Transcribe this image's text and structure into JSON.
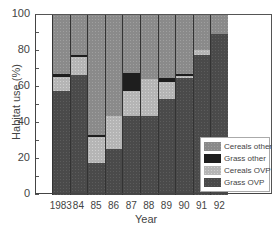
{
  "chart_data": {
    "type": "bar",
    "stacked": true,
    "title": "",
    "xlabel": "Year",
    "ylabel": "Habitat use (%)",
    "ylim": [
      0,
      100
    ],
    "yticks": [
      "0",
      "20",
      "40",
      "60",
      "80",
      "100"
    ],
    "categories": [
      "1983",
      "84",
      "85",
      "86",
      "87",
      "88",
      "89",
      "90",
      "91",
      "92"
    ],
    "series": [
      {
        "name": "Grass OVP",
        "values": [
          58,
          66.5,
          18,
          25.5,
          44,
          44,
          53.5,
          65,
          78,
          89.5
        ]
      },
      {
        "name": "Cereals OVP",
        "values": [
          7.5,
          10,
          14,
          18.5,
          14,
          20.5,
          9.5,
          1,
          2.5,
          0
        ]
      },
      {
        "name": "Grass other",
        "values": [
          1.5,
          1.5,
          1.5,
          0,
          10,
          0,
          2,
          1,
          0,
          0
        ]
      },
      {
        "name": "Cereals other",
        "values": [
          33,
          22,
          66.5,
          56,
          32,
          35.5,
          35,
          33,
          19.5,
          10.5
        ]
      }
    ],
    "legend": [
      "Cereals other",
      "Grass other",
      "Cereals OVP",
      "Grass OVP"
    ],
    "legend_position": "lower right",
    "grid": false
  }
}
